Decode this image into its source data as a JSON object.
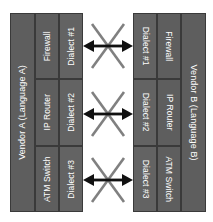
{
  "diagram": {
    "colors": {
      "panel": "#5e5e5e",
      "panel_alt": "#636363",
      "panel_border": "#3a3a3a",
      "label_text": "#ffffff",
      "arrow": "#111111",
      "diagonal": "#808080",
      "background": "#ffffff"
    }
  },
  "vendor_a": {
    "name": "Vendor A (Language A)",
    "rows": [
      {
        "device": "Firewall",
        "dialect": "Dialect #1"
      },
      {
        "device": "IP Router",
        "dialect": "Dialect #2"
      },
      {
        "device": "ATM Switch",
        "dialect": "Dialect #3"
      }
    ]
  },
  "vendor_b": {
    "name": "Vendor B (Language B)",
    "rows": [
      {
        "dialect": "Dialect #1",
        "device": "Firewall"
      },
      {
        "dialect": "Dialect #2",
        "device": "IP Router"
      },
      {
        "dialect": "Dialect #3",
        "device": "ATM Switch"
      }
    ]
  },
  "connectors": [
    {
      "id": "connector-1",
      "kind": "bidirectional-blocked",
      "links": "Dialect #1 to Dialect #1"
    },
    {
      "id": "connector-2",
      "kind": "bidirectional-blocked",
      "links": "Dialect #2 to Dialect #2"
    },
    {
      "id": "connector-3",
      "kind": "bidirectional-blocked",
      "links": "Dialect #3 to Dialect #3"
    }
  ]
}
